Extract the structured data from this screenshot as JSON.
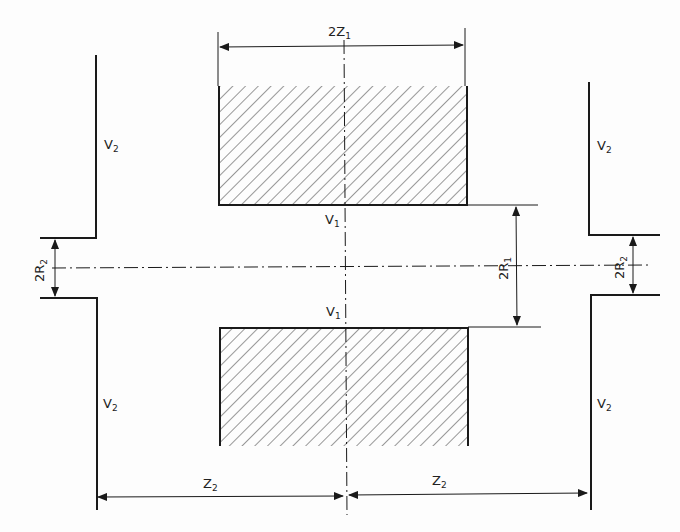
{
  "diagram": {
    "labels": {
      "width_inner": {
        "main": "2Z",
        "sub": "1"
      },
      "v2_top_left": {
        "main": "V",
        "sub": "2"
      },
      "v2_top_right": {
        "main": "V",
        "sub": "2"
      },
      "v2_bottom_left": {
        "main": "V",
        "sub": "2"
      },
      "v2_bottom_right": {
        "main": "V",
        "sub": "2"
      },
      "v1_top": {
        "main": "V",
        "sub": "1"
      },
      "v1_bottom": {
        "main": "V",
        "sub": "1"
      },
      "radius_outer_left": {
        "main": "2R",
        "sub": "2"
      },
      "radius_outer_right": {
        "main": "2R",
        "sub": "2"
      },
      "radius_inner": {
        "main": "2R",
        "sub": "1"
      },
      "z2_left": {
        "main": "Z",
        "sub": "2"
      },
      "z2_right": {
        "main": "Z",
        "sub": "2"
      }
    },
    "colors": {
      "line": "#1a1a1a",
      "hatch": "#333333"
    }
  }
}
